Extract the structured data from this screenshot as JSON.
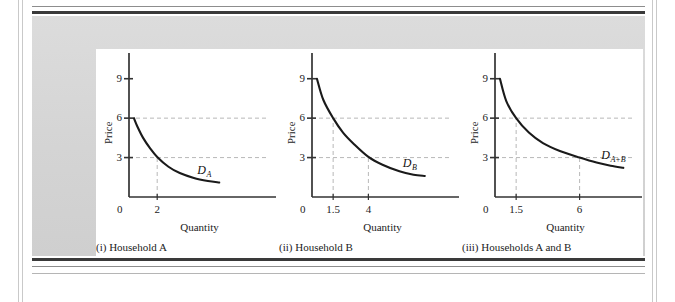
{
  "figure": {
    "background_color": "#d8d8d8",
    "canvas_color": "#ffffff",
    "curve_color": "#1a1a1a",
    "guide_color": "#b0b0b0",
    "axis_color": "#333333"
  },
  "chart_data": [
    {
      "type": "line",
      "id": "household-a",
      "title": "",
      "caption": "(i) Household A",
      "xlabel": "Quantity",
      "ylabel": "Price",
      "xlim": [
        0,
        10
      ],
      "ylim": [
        0,
        10.5
      ],
      "grid": false,
      "legend": "inside-right",
      "curve_label": "D",
      "curve_label_sub": "A",
      "y_ticks": [
        "9",
        "6",
        "3"
      ],
      "y_tick_values": [
        9,
        6,
        3
      ],
      "x_ticks": [
        "0",
        "2"
      ],
      "x_tick_values": [
        0,
        2
      ],
      "origin_label": "0",
      "guide_prices": [
        6,
        3
      ],
      "drop_quantities": [
        2
      ],
      "series": [
        {
          "name": "D_A",
          "x": [
            0.35,
            0.6,
            1.0,
            1.5,
            2.0,
            2.8,
            3.6,
            4.6,
            5.6,
            6.4
          ],
          "y": [
            6.0,
            5.35,
            4.5,
            3.7,
            3.05,
            2.3,
            1.82,
            1.45,
            1.22,
            1.1
          ]
        }
      ]
    },
    {
      "type": "line",
      "id": "household-b",
      "title": "",
      "caption": "(ii) Household B",
      "xlabel": "Quantity",
      "ylabel": "Price",
      "xlim": [
        0,
        10
      ],
      "ylim": [
        0,
        10.5
      ],
      "grid": false,
      "legend": "inside-right",
      "curve_label": "D",
      "curve_label_sub": "B",
      "y_ticks": [
        "9",
        "6",
        "3"
      ],
      "y_tick_values": [
        9,
        6,
        3
      ],
      "x_ticks": [
        "0",
        "1.5",
        "4"
      ],
      "x_tick_values": [
        0,
        1.5,
        4
      ],
      "origin_label": "0",
      "guide_prices": [
        6,
        3
      ],
      "drop_quantities": [
        1.5,
        4
      ],
      "series": [
        {
          "name": "D_B",
          "x": [
            0.35,
            0.8,
            1.5,
            2.2,
            3.0,
            4.0,
            5.0,
            6.2,
            7.2,
            8.0
          ],
          "y": [
            9.0,
            7.4,
            6.0,
            4.9,
            4.0,
            3.05,
            2.45,
            1.95,
            1.7,
            1.6
          ]
        }
      ]
    },
    {
      "type": "line",
      "id": "households-a-and-b",
      "title": "",
      "caption": "(iii) Households A and B",
      "xlabel": "Quantity",
      "ylabel": "Price",
      "xlim": [
        0,
        10
      ],
      "ylim": [
        0,
        10.5
      ],
      "grid": false,
      "legend": "inside-right",
      "curve_label": "D",
      "curve_label_sub": "A+B",
      "y_ticks": [
        "9",
        "6",
        "3"
      ],
      "y_tick_values": [
        9,
        6,
        3
      ],
      "x_ticks": [
        "0",
        "1.5",
        "6"
      ],
      "x_tick_values": [
        0,
        1.5,
        6
      ],
      "origin_label": "0",
      "guide_prices": [
        6,
        3
      ],
      "drop_quantities": [
        1.5,
        6
      ],
      "series": [
        {
          "name": "D_A+B",
          "x": [
            0.35,
            0.8,
            1.5,
            2.4,
            3.4,
            4.6,
            6.0,
            7.2,
            8.2,
            9.1
          ],
          "y": [
            9.0,
            7.3,
            6.0,
            4.9,
            4.1,
            3.5,
            3.0,
            2.62,
            2.38,
            2.22
          ]
        }
      ]
    }
  ]
}
